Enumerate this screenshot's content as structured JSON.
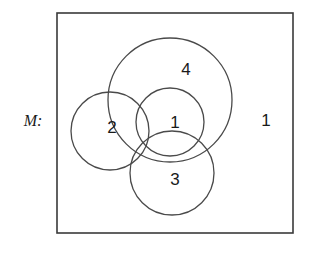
{
  "diagram": {
    "kind": "venn-diagram",
    "universe_label": "M:",
    "frame": {
      "x": 57,
      "y": 13,
      "width": 236,
      "height": 220,
      "stroke": "#3a3a3a"
    },
    "circles": [
      {
        "name": "circle-4",
        "label": "4",
        "cx": 170,
        "cy": 100,
        "r": 62,
        "label_x": 186,
        "label_y": 71,
        "stroke": "#4a4a4a"
      },
      {
        "name": "circle-2",
        "label": "2",
        "cx": 110,
        "cy": 131,
        "r": 39,
        "label_x": 112,
        "label_y": 129,
        "stroke": "#4a4a4a"
      },
      {
        "name": "circle-3",
        "label": "3",
        "cx": 172,
        "cy": 173,
        "r": 42,
        "label_x": 175,
        "label_y": 181,
        "stroke": "#4a4a4a"
      },
      {
        "name": "circle-1",
        "label": "1",
        "cx": 170,
        "cy": 122,
        "r": 34,
        "label_x": 175,
        "label_y": 124,
        "stroke": "#4a4a4a"
      }
    ],
    "outside_label": {
      "name": "region-label-outside",
      "text": "1",
      "x": 266,
      "y": 122
    },
    "universe_label_pos": {
      "x": 33,
      "y": 122
    }
  },
  "chart_data": {
    "type": "diagram",
    "title": "M:",
    "regions": [
      {
        "label": "4",
        "position": "large-top-circle"
      },
      {
        "label": "2",
        "position": "left-circle"
      },
      {
        "label": "1",
        "position": "center-circle"
      },
      {
        "label": "3",
        "position": "bottom-circle"
      },
      {
        "label": "1",
        "position": "outside-all-circles-inside-frame"
      }
    ]
  }
}
